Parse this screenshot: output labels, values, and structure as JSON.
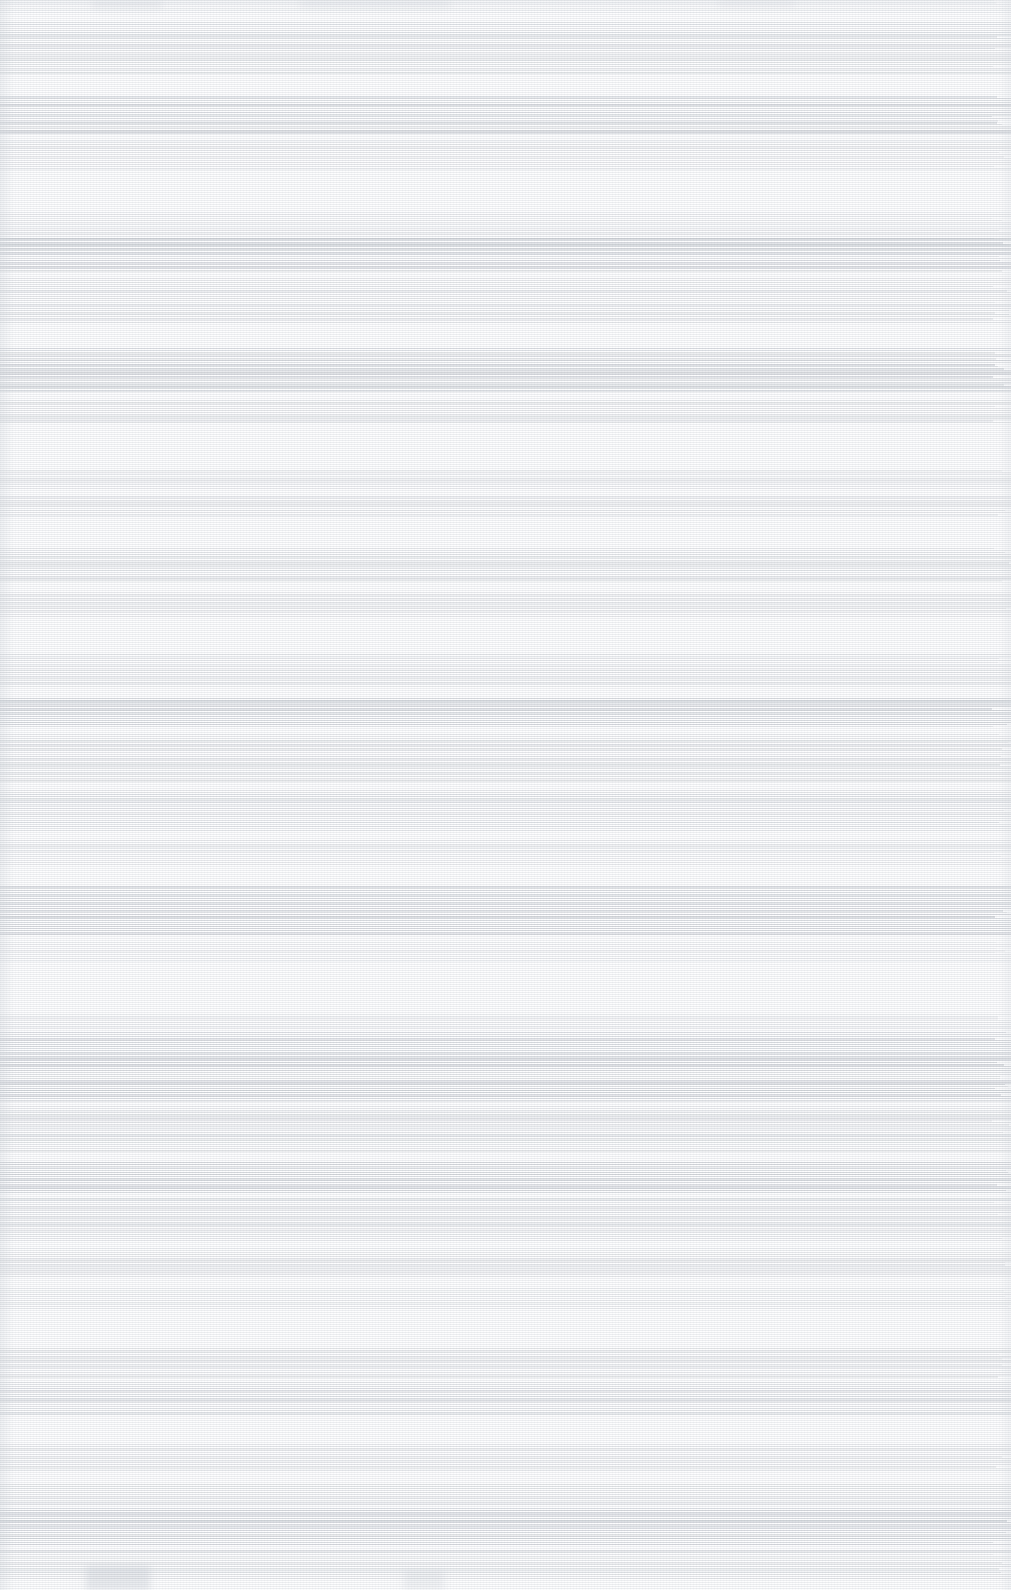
{
  "document": {
    "legibility": "none",
    "condition_note": "Severely degraded scan: horizontal scan-line artifacts, near-white luminance, no readable glyphs at any magnification.",
    "width": 1011,
    "height": 1590,
    "column_layout": "single-column full-bleed",
    "text_content": "",
    "page_background": "#fdfdfe",
    "ink_color": "#969ea8",
    "blocks": [
      {
        "top": 0,
        "height": 14,
        "density": 0.22,
        "weight": "light"
      },
      {
        "top": 22,
        "height": 52,
        "density": 0.52,
        "weight": "medium"
      },
      {
        "top": 96,
        "height": 38,
        "density": 0.78,
        "weight": "heavy"
      },
      {
        "top": 140,
        "height": 30,
        "density": 0.4,
        "weight": "light"
      },
      {
        "top": 212,
        "height": 30,
        "density": 0.34,
        "weight": "light"
      },
      {
        "top": 238,
        "height": 34,
        "density": 0.86,
        "weight": "heavy"
      },
      {
        "top": 278,
        "height": 46,
        "density": 0.48,
        "weight": "medium"
      },
      {
        "top": 348,
        "height": 44,
        "density": 0.8,
        "weight": "heavy"
      },
      {
        "top": 400,
        "height": 24,
        "density": 0.42,
        "weight": "medium"
      },
      {
        "top": 470,
        "height": 20,
        "density": 0.3,
        "weight": "light"
      },
      {
        "top": 496,
        "height": 22,
        "density": 0.44,
        "weight": "medium"
      },
      {
        "top": 548,
        "height": 34,
        "density": 0.5,
        "weight": "medium"
      },
      {
        "top": 592,
        "height": 26,
        "density": 0.38,
        "weight": "light"
      },
      {
        "top": 654,
        "height": 34,
        "density": 0.46,
        "weight": "medium"
      },
      {
        "top": 698,
        "height": 30,
        "density": 0.84,
        "weight": "heavy"
      },
      {
        "top": 734,
        "height": 48,
        "density": 0.52,
        "weight": "medium"
      },
      {
        "top": 790,
        "height": 42,
        "density": 0.56,
        "weight": "medium"
      },
      {
        "top": 840,
        "height": 26,
        "density": 0.36,
        "weight": "light"
      },
      {
        "top": 886,
        "height": 50,
        "density": 0.82,
        "weight": "heavy"
      },
      {
        "top": 942,
        "height": 20,
        "density": 0.34,
        "weight": "light"
      },
      {
        "top": 1014,
        "height": 16,
        "density": 0.3,
        "weight": "light"
      },
      {
        "top": 1032,
        "height": 70,
        "density": 0.88,
        "weight": "heavy"
      },
      {
        "top": 1106,
        "height": 46,
        "density": 0.54,
        "weight": "medium"
      },
      {
        "top": 1162,
        "height": 32,
        "density": 0.86,
        "weight": "heavy"
      },
      {
        "top": 1198,
        "height": 44,
        "density": 0.5,
        "weight": "medium"
      },
      {
        "top": 1248,
        "height": 30,
        "density": 0.4,
        "weight": "light"
      },
      {
        "top": 1288,
        "height": 22,
        "density": 0.32,
        "weight": "light"
      },
      {
        "top": 1348,
        "height": 30,
        "density": 0.44,
        "weight": "medium"
      },
      {
        "top": 1382,
        "height": 34,
        "density": 0.58,
        "weight": "medium"
      },
      {
        "top": 1444,
        "height": 28,
        "density": 0.4,
        "weight": "light"
      },
      {
        "top": 1484,
        "height": 22,
        "density": 0.46,
        "weight": "medium"
      },
      {
        "top": 1508,
        "height": 38,
        "density": 0.9,
        "weight": "heavy"
      },
      {
        "top": 1550,
        "height": 30,
        "density": 0.52,
        "weight": "medium"
      }
    ]
  }
}
